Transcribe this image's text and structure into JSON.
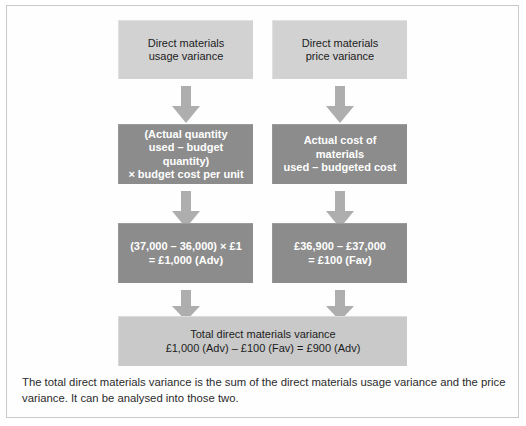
{
  "diagram": {
    "type": "flowchart",
    "colors": {
      "box_light": "#d2d2d2",
      "box_dark": "#8c8c8c",
      "box_total": "#c9c9c9",
      "shadow": "#8e8e8e",
      "arrow_fill": "#aeaeae",
      "frame_border": "#c9c9c9",
      "page_background": "#ffffff",
      "text_dark": "#1c1c1c",
      "text_light": "#ffffff"
    },
    "columns": {
      "left": {
        "header": "Direct materials\nusage variance",
        "formula": "(Actual quantity\nused – budget quantity)\n× budget cost per unit",
        "calculation": "(37,000 – 36,000) × £1\n= £1,000 (Adv)"
      },
      "right": {
        "header": "Direct materials\nprice variance",
        "formula": "Actual cost of materials\nused – budgeted cost",
        "calculation": "£36,900 – £37,000\n= £100 (Fav)"
      }
    },
    "total_box": {
      "line1": "Total direct materials variance",
      "line2": "£1,000 (Adv) – £100 (Fav) = £900 (Adv)"
    },
    "arrows": {
      "label": "downward-arrow",
      "count": 6
    }
  },
  "caption": {
    "text": "The total direct materials variance is the sum of the direct materials usage variance and the price variance. It can be analysed into those two."
  }
}
